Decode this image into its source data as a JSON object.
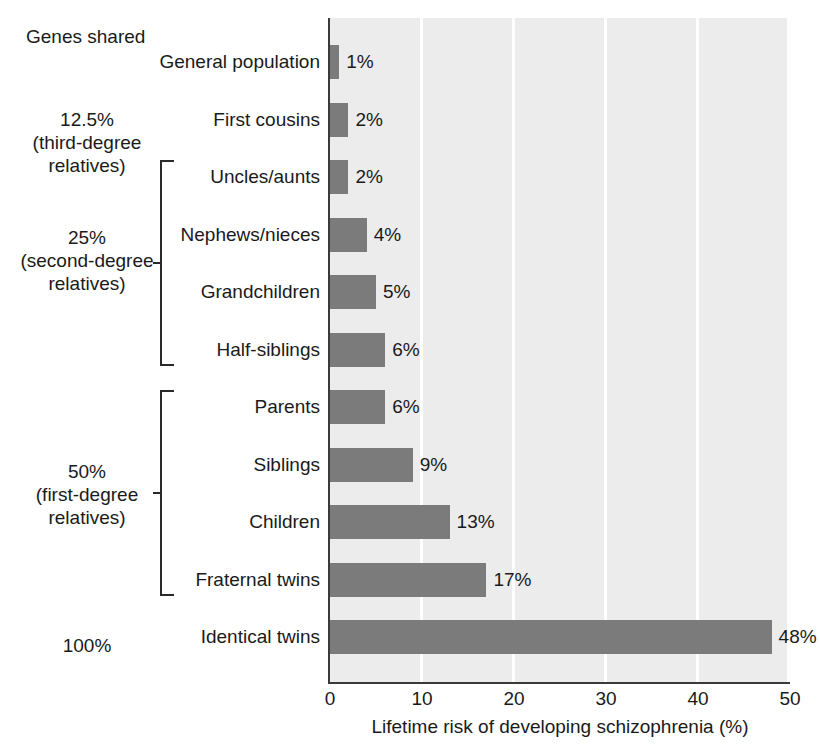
{
  "chart_data": {
    "type": "bar",
    "orientation": "horizontal",
    "title": "",
    "xlabel": "Lifetime risk of developing schizophrenia (%)",
    "ylabel": "",
    "xlim": [
      0,
      50
    ],
    "xticks": [
      0,
      10,
      20,
      30,
      40,
      50
    ],
    "grid": "vertical-white-gridlines",
    "legend": "none",
    "bar_color": "#7b7b7b",
    "plot_background": "#ececec",
    "categories": [
      "General population",
      "First cousins",
      "Uncles/aunts",
      "Nephews/nieces",
      "Grandchildren",
      "Half-siblings",
      "Parents",
      "Siblings",
      "Children",
      "Fraternal twins",
      "Identical twins"
    ],
    "values": [
      1,
      2,
      2,
      4,
      5,
      6,
      6,
      9,
      13,
      17,
      48
    ],
    "value_labels": [
      "1%",
      "2%",
      "2%",
      "4%",
      "5%",
      "6%",
      "6%",
      "9%",
      "13%",
      "17%",
      "48%"
    ]
  },
  "genes_shared": {
    "header": "Genes shared",
    "groups": [
      {
        "lines": [
          "12.5%",
          "(third-degree",
          "relatives)"
        ],
        "has_bracket": false,
        "members": [
          "Uncles/aunts"
        ]
      },
      {
        "lines": [
          "25%",
          "(second-degree",
          "relatives)"
        ],
        "has_bracket": true,
        "members": [
          "Nephews/nieces",
          "Grandchildren",
          "Half-siblings"
        ]
      },
      {
        "lines": [
          "50%",
          "(first-degree",
          "relatives)"
        ],
        "has_bracket": true,
        "members": [
          "Parents",
          "Siblings",
          "Children",
          "Fraternal twins"
        ]
      },
      {
        "lines": [
          "100%"
        ],
        "has_bracket": false,
        "members": [
          "Identical twins"
        ]
      }
    ]
  }
}
